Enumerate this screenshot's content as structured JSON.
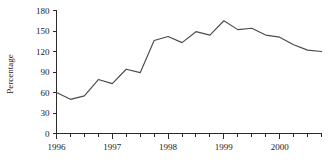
{
  "chart_data": {
    "type": "line",
    "title": "",
    "xlabel": "",
    "ylabel": "Percentage",
    "ylim": [
      0,
      180
    ],
    "yticks": [
      0,
      30,
      60,
      90,
      120,
      150,
      180
    ],
    "ytick_labels": [
      "0",
      "30",
      "60",
      "90",
      "120",
      "150",
      "180"
    ],
    "xlim": [
      1996.0,
      2000.75
    ],
    "xticks": [
      1996,
      1997,
      1998,
      1999,
      2000
    ],
    "xtick_labels": [
      "1996",
      "1997",
      "1998",
      "1999",
      "2000"
    ],
    "x_minor_tick_interval": 0.25,
    "grid": false,
    "legend": "none",
    "series": [
      {
        "name": "Percentage",
        "x": [
          1996.0,
          1996.25,
          1996.5,
          1996.75,
          1997.0,
          1997.25,
          1997.5,
          1997.75,
          1998.0,
          1998.25,
          1998.5,
          1998.75,
          1999.0,
          1999.25,
          1999.5,
          1999.75,
          2000.0,
          2000.25,
          2000.5,
          2000.75
        ],
        "values": [
          60,
          50,
          55,
          79,
          73,
          94,
          89,
          136,
          142,
          133,
          149,
          144,
          165,
          152,
          154,
          144,
          141,
          130,
          122,
          120
        ]
      }
    ],
    "annotations": []
  },
  "axis": {
    "y_title": "Percentage"
  }
}
